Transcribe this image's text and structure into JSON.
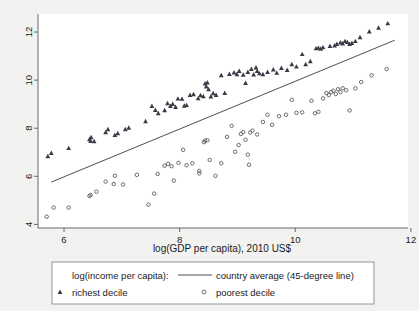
{
  "chart_data": {
    "type": "scatter",
    "title": "",
    "subtitle": "",
    "xlabel": "log(GDP per capita), 2010 US$",
    "ylabel": "",
    "xlim": [
      5.55,
      11.95
    ],
    "ylim": [
      3.85,
      12.75
    ],
    "xticks": [
      6,
      8,
      10,
      12
    ],
    "yticks": [
      4,
      6,
      8,
      10,
      12
    ],
    "xticklabels": [
      "6",
      "8",
      "10",
      "12"
    ],
    "yticklabels": [
      "4",
      "6",
      "8",
      "10",
      "12"
    ],
    "grid": false,
    "legend_position": "below-plot",
    "background": "#f2f2f0",
    "plot_background": "#ffffff",
    "reference_line": {
      "name": "country average (45-degree line)",
      "type": "identity",
      "x0": 5.78,
      "y0": 5.76,
      "x1": 11.72,
      "y1": 11.66,
      "color": "#4e4e5a"
    },
    "series": [
      {
        "name": "richest decile",
        "marker": "triangle",
        "color": "#3a3a46",
        "points": [
          [
            5.72,
            6.83
          ],
          [
            5.78,
            6.97
          ],
          [
            6.08,
            7.17
          ],
          [
            6.44,
            7.54
          ],
          [
            6.46,
            7.47
          ],
          [
            6.47,
            7.62
          ],
          [
            6.52,
            7.46
          ],
          [
            6.72,
            7.83
          ],
          [
            6.76,
            7.96
          ],
          [
            6.88,
            7.72
          ],
          [
            6.93,
            7.79
          ],
          [
            7.06,
            7.96
          ],
          [
            7.12,
            8.02
          ],
          [
            7.41,
            8.29
          ],
          [
            7.52,
            8.92
          ],
          [
            7.58,
            8.76
          ],
          [
            7.63,
            8.62
          ],
          [
            7.74,
            8.75
          ],
          [
            7.79,
            9.04
          ],
          [
            7.84,
            8.92
          ],
          [
            7.88,
            9.01
          ],
          [
            7.93,
            8.88
          ],
          [
            7.97,
            9.23
          ],
          [
            8.04,
            9.22
          ],
          [
            8.08,
            8.93
          ],
          [
            8.12,
            8.96
          ],
          [
            8.18,
            9.38
          ],
          [
            8.24,
            9.41
          ],
          [
            8.32,
            9.24
          ],
          [
            8.36,
            9.37
          ],
          [
            8.41,
            9.33
          ],
          [
            8.44,
            9.86
          ],
          [
            8.46,
            9.73
          ],
          [
            8.48,
            9.9
          ],
          [
            8.5,
            9.62
          ],
          [
            8.54,
            9.32
          ],
          [
            8.58,
            9.45
          ],
          [
            8.63,
            9.38
          ],
          [
            8.72,
            10.2
          ],
          [
            8.78,
            9.46
          ],
          [
            8.86,
            10.25
          ],
          [
            8.94,
            10.32
          ],
          [
            8.99,
            10.24
          ],
          [
            9.03,
            10.38
          ],
          [
            9.1,
            10.22
          ],
          [
            9.14,
            9.88
          ],
          [
            9.18,
            10.34
          ],
          [
            9.24,
            10.46
          ],
          [
            9.28,
            10.23
          ],
          [
            9.32,
            10.52
          ],
          [
            9.34,
            10.38
          ],
          [
            9.38,
            10.28
          ],
          [
            9.44,
            10.24
          ],
          [
            9.52,
            10.34
          ],
          [
            9.62,
            10.44
          ],
          [
            9.68,
            10.3
          ],
          [
            9.76,
            10.5
          ],
          [
            9.86,
            10.42
          ],
          [
            9.94,
            10.66
          ],
          [
            10.02,
            10.56
          ],
          [
            10.12,
            11.08
          ],
          [
            10.18,
            10.66
          ],
          [
            10.26,
            10.78
          ],
          [
            10.36,
            11.32
          ],
          [
            10.4,
            11.34
          ],
          [
            10.44,
            11.3
          ],
          [
            10.48,
            11.36
          ],
          [
            10.6,
            11.42
          ],
          [
            10.68,
            11.44
          ],
          [
            10.72,
            11.5
          ],
          [
            10.78,
            11.56
          ],
          [
            10.82,
            11.52
          ],
          [
            10.86,
            11.62
          ],
          [
            10.9,
            11.58
          ],
          [
            10.94,
            11.5
          ],
          [
            10.98,
            11.54
          ],
          [
            11.04,
            11.62
          ],
          [
            11.12,
            11.78
          ],
          [
            11.28,
            12.02
          ],
          [
            11.44,
            12.18
          ],
          [
            11.6,
            12.36
          ]
        ]
      },
      {
        "name": "poorest decile",
        "marker": "circle",
        "color": "#55555f",
        "points": [
          [
            5.7,
            4.32
          ],
          [
            5.82,
            4.7
          ],
          [
            6.08,
            4.7
          ],
          [
            6.44,
            5.18
          ],
          [
            6.46,
            5.22
          ],
          [
            6.56,
            5.36
          ],
          [
            6.72,
            5.78
          ],
          [
            6.86,
            5.68
          ],
          [
            7.02,
            5.66
          ],
          [
            6.88,
            6.02
          ],
          [
            7.26,
            6.06
          ],
          [
            7.46,
            4.82
          ],
          [
            7.56,
            5.28
          ],
          [
            7.62,
            6.1
          ],
          [
            7.74,
            6.44
          ],
          [
            7.8,
            6.52
          ],
          [
            7.86,
            6.42
          ],
          [
            7.9,
            5.82
          ],
          [
            7.98,
            6.56
          ],
          [
            8.06,
            7.1
          ],
          [
            8.12,
            6.46
          ],
          [
            8.22,
            6.54
          ],
          [
            8.34,
            6.12
          ],
          [
            8.34,
            6.22
          ],
          [
            8.42,
            7.42
          ],
          [
            8.44,
            7.48
          ],
          [
            8.48,
            7.5
          ],
          [
            8.52,
            6.68
          ],
          [
            8.62,
            6.02
          ],
          [
            8.72,
            6.54
          ],
          [
            8.82,
            7.64
          ],
          [
            8.9,
            8.1
          ],
          [
            8.96,
            7.02
          ],
          [
            9.02,
            7.3
          ],
          [
            9.06,
            7.76
          ],
          [
            9.1,
            7.84
          ],
          [
            9.14,
            7.52
          ],
          [
            9.18,
            6.9
          ],
          [
            9.2,
            6.48
          ],
          [
            9.22,
            7.82
          ],
          [
            9.26,
            7.9
          ],
          [
            9.34,
            7.74
          ],
          [
            9.44,
            8.26
          ],
          [
            9.52,
            8.56
          ],
          [
            9.6,
            8.14
          ],
          [
            9.72,
            8.5
          ],
          [
            9.84,
            8.56
          ],
          [
            9.94,
            9.18
          ],
          [
            10.02,
            8.64
          ],
          [
            10.12,
            8.66
          ],
          [
            10.28,
            9.14
          ],
          [
            10.34,
            8.62
          ],
          [
            10.4,
            8.68
          ],
          [
            10.48,
            9.24
          ],
          [
            10.54,
            9.46
          ],
          [
            10.58,
            9.38
          ],
          [
            10.62,
            9.5
          ],
          [
            10.66,
            9.56
          ],
          [
            10.7,
            9.42
          ],
          [
            10.74,
            9.62
          ],
          [
            10.78,
            9.5
          ],
          [
            10.82,
            9.66
          ],
          [
            10.88,
            9.58
          ],
          [
            10.94,
            8.74
          ],
          [
            11.04,
            9.66
          ],
          [
            11.14,
            9.92
          ],
          [
            11.32,
            10.2
          ],
          [
            11.58,
            10.46
          ]
        ]
      }
    ],
    "legend": {
      "header": "log(income per capita):",
      "entries": [
        {
          "label": "country average (45-degree line)",
          "marker": "line"
        },
        {
          "label": "richest decile",
          "marker": "triangle"
        },
        {
          "label": "poorest decile",
          "marker": "circle"
        }
      ]
    }
  }
}
